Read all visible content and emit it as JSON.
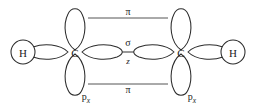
{
  "diagram": {
    "background_color": "#ffffff",
    "stroke_color": "#2b2b2b",
    "line_color": "#555555",
    "atoms": [
      {
        "id": "h-left",
        "label": "H",
        "cx": 23,
        "cy": 52
      },
      {
        "id": "c-left",
        "label": "C",
        "cx": 75,
        "cy": 52
      },
      {
        "id": "c-right",
        "label": "C",
        "cx": 181,
        "cy": 52
      },
      {
        "id": "h-right",
        "label": "H",
        "cx": 233,
        "cy": 52
      }
    ],
    "labels": {
      "pi_top": "π",
      "pi_bottom": "π",
      "sigma": "σ",
      "axis_z": "z",
      "p_orbital_letter": "p",
      "p_orbital_subscript": "x"
    },
    "label_positions": {
      "pi_top": {
        "x": 128,
        "y": 14
      },
      "pi_bottom": {
        "x": 128,
        "y": 92
      },
      "sigma": {
        "x": 128,
        "y": 45
      },
      "axis_z": {
        "x": 128,
        "y": 62
      },
      "px_left": {
        "x": 86,
        "y": 99
      },
      "px_right": {
        "x": 192,
        "y": 99
      }
    },
    "reference_lines": [
      {
        "id": "pi-top-line",
        "x1": 88,
        "y1": 18,
        "x2": 168,
        "y2": 18
      },
      {
        "id": "pi-bottom-line",
        "x1": 88,
        "y1": 84,
        "x2": 168,
        "y2": 84
      }
    ],
    "sigma_bond": {
      "x1": 120,
      "y1": 52,
      "x2": 136,
      "y2": 52
    }
  }
}
